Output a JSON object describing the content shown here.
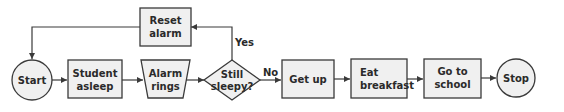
{
  "diagram": {
    "type": "flowchart",
    "nodes": {
      "start": {
        "label_lines": [
          "Start"
        ],
        "shape": "circle"
      },
      "student_asleep": {
        "label_lines": [
          "Student",
          "asleep"
        ],
        "shape": "rectangle"
      },
      "alarm_rings": {
        "label_lines": [
          "Alarm",
          "rings"
        ],
        "shape": "trapezoid"
      },
      "still_sleepy": {
        "label_lines": [
          "Still",
          "sleepy?"
        ],
        "shape": "diamond"
      },
      "reset_alarm": {
        "label_lines": [
          "Reset",
          "alarm"
        ],
        "shape": "rectangle"
      },
      "get_up": {
        "label_lines": [
          "Get up"
        ],
        "shape": "rectangle"
      },
      "eat_breakfast": {
        "label_lines": [
          "Eat",
          "breakfast"
        ],
        "shape": "rectangle"
      },
      "go_to_school": {
        "label_lines": [
          "Go to",
          "school"
        ],
        "shape": "rectangle"
      },
      "stop": {
        "label_lines": [
          "Stop"
        ],
        "shape": "circle"
      }
    },
    "edges": {
      "yes_label": "Yes",
      "no_label": "No"
    },
    "colors": {
      "fill": "#f0f0f0",
      "stroke": "#3a3a3a",
      "text": "#2a2a2a"
    }
  }
}
